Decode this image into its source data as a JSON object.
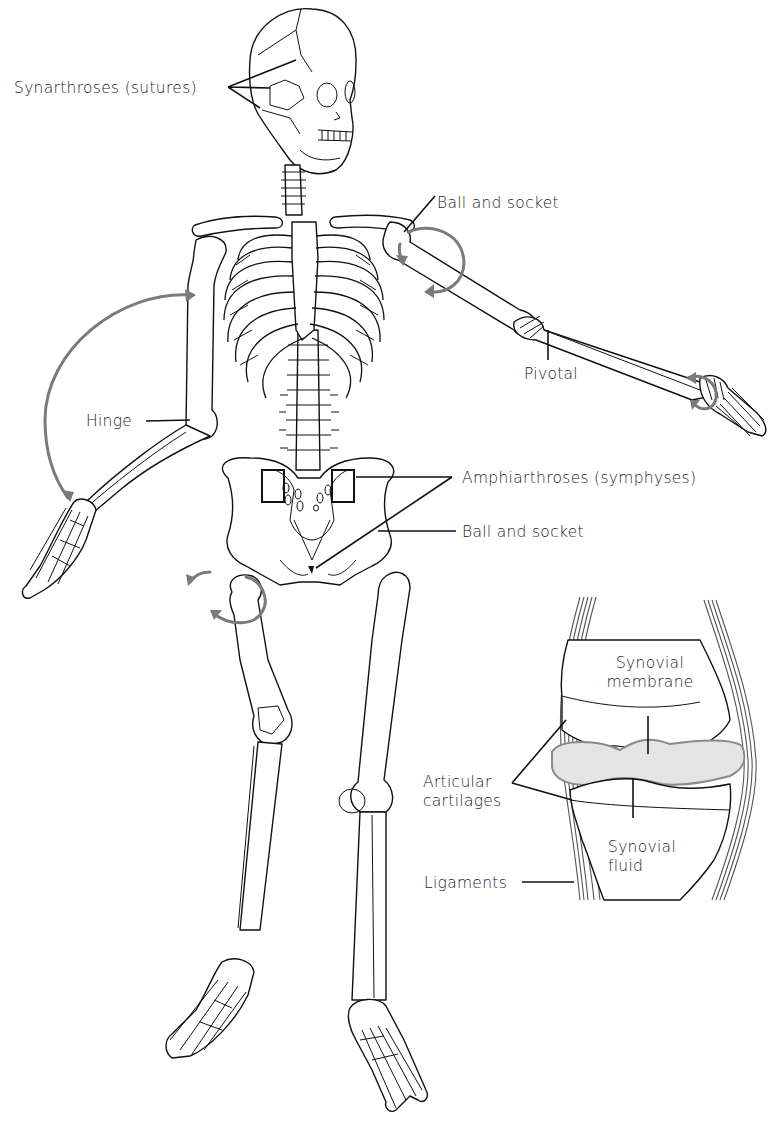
{
  "figure": {
    "background": "#ffffff",
    "arrow_color": "#7a7a7a",
    "line_color": "#111111"
  },
  "labels": {
    "synarthroses": "Synarthroses (sutures)",
    "ball_socket_shoulder": "Ball and socket",
    "pivotal": "Pivotal",
    "hinge": "Hinge",
    "amphiarthroses": "Amphiarthroses (symphyses)",
    "ball_socket_hip": "Ball and socket"
  },
  "inset": {
    "title": "Synovial joint cross-section",
    "labels": {
      "synovial_membrane": "Synovial membrane",
      "articular_cartilages": "Articular cartilages",
      "synovial_fluid": "Synovial fluid",
      "ligaments": "Ligaments"
    }
  },
  "annotations": [
    {
      "id": "synarthroses",
      "text": "Synarthroses (sutures)",
      "x": 14,
      "y": 79,
      "points_to": "skull sutures"
    },
    {
      "id": "ball_socket_shoulder",
      "text": "Ball and socket",
      "x": 437,
      "y": 194,
      "points_to": "shoulder joint"
    },
    {
      "id": "pivotal",
      "text": "Pivotal",
      "x": 524,
      "y": 365,
      "points_to": "elbow (radio-ulnar)"
    },
    {
      "id": "hinge",
      "text": "Hinge",
      "x": 86,
      "y": 412,
      "points_to": "elbow"
    },
    {
      "id": "amphiarthroses",
      "text": "Amphiarthroses (symphyses)",
      "x": 462,
      "y": 470,
      "points_to": "sacroiliac and pubic symphysis"
    },
    {
      "id": "ball_socket_hip",
      "text": "Ball and socket",
      "x": 462,
      "y": 524,
      "points_to": "hip joint"
    },
    {
      "id": "synovial_membrane",
      "text": "Synovial membrane",
      "x": 601,
      "y": 654,
      "points_to": "membrane"
    },
    {
      "id": "articular_cartilages",
      "text": "Articular cartilages",
      "x": 423,
      "y": 773,
      "points_to": "cartilage surfaces"
    },
    {
      "id": "synovial_fluid",
      "text": "Synovial fluid",
      "x": 608,
      "y": 838,
      "points_to": "joint cavity"
    },
    {
      "id": "ligaments",
      "text": "Ligaments",
      "x": 424,
      "y": 876,
      "points_to": "lateral ligament"
    }
  ]
}
